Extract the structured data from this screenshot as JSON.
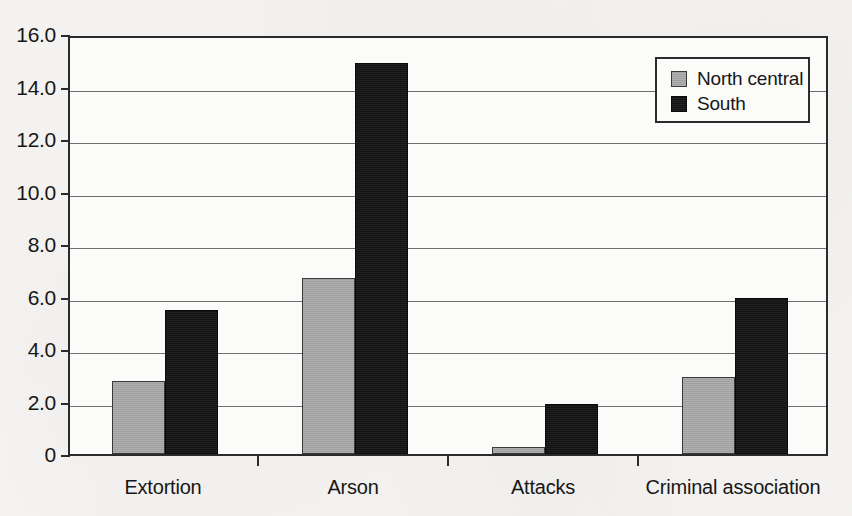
{
  "chart_data": {
    "type": "bar",
    "title": "",
    "subtitle": "",
    "xlabel": "",
    "ylabel": "",
    "categories": [
      "Extortion",
      "Arson",
      "Attacks",
      "Criminal association"
    ],
    "series": [
      {
        "name": "North central",
        "color": "#a9a9a9",
        "values": [
          2.8,
          6.7,
          0.25,
          2.95
        ]
      },
      {
        "name": "South",
        "color": "#141414",
        "values": [
          5.5,
          14.9,
          1.9,
          5.95
        ]
      }
    ],
    "ylim": [
      0,
      16
    ],
    "ytick_labels": [
      "16.0",
      "14.0",
      "12.0",
      "10.0",
      "8.0",
      "6.0",
      "4.0",
      "2.0",
      "0"
    ],
    "ytick_values": [
      16,
      14,
      12,
      10,
      8,
      6,
      4,
      2,
      0
    ],
    "grid": true,
    "grid_axis": "y",
    "legend": {
      "position": "top-right",
      "entries": [
        "North central",
        "South"
      ]
    },
    "background_color": "#f6f5f3",
    "plot_background_color": "#fbfbfa",
    "axis_color": "#2b2b2b"
  }
}
